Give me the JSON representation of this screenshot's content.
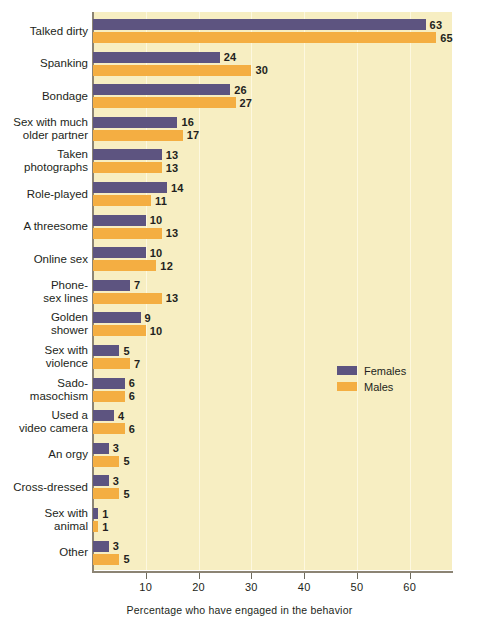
{
  "chart_data": {
    "type": "bar",
    "orientation": "horizontal",
    "title": "",
    "xlabel": "Percentage who have engaged in the behavior",
    "ylabel": "",
    "xlim": [
      0,
      68
    ],
    "xticks": [
      10,
      20,
      30,
      40,
      50,
      60
    ],
    "xticklabels": [
      "10",
      "20",
      "30",
      "40",
      "50",
      "60"
    ],
    "grid": true,
    "grid_axis": "x",
    "legend_position": "center-right",
    "categories": [
      "Talked dirty",
      "Spanking",
      "Bondage",
      "Sex with much\nolder partner",
      "Taken\nphotographs",
      "Role-played",
      "A threesome",
      "Online sex",
      "Phone-\nsex lines",
      "Golden\nshower",
      "Sex with\nviolence",
      "Sado-\nmasochism",
      "Used a\nvideo camera",
      "An orgy",
      "Cross-dressed",
      "Sex with\nanimal",
      "Other"
    ],
    "series": [
      {
        "name": "Females",
        "color": "#5d5480",
        "values": [
          63,
          24,
          26,
          16,
          13,
          14,
          10,
          10,
          7,
          9,
          5,
          6,
          4,
          3,
          3,
          1,
          3
        ]
      },
      {
        "name": "Males",
        "color": "#f4ae42",
        "values": [
          65,
          30,
          27,
          17,
          13,
          11,
          13,
          12,
          13,
          10,
          7,
          6,
          6,
          5,
          5,
          1,
          5
        ]
      }
    ]
  },
  "colors": {
    "plot_background": "#f7eec2",
    "page_background": "#ffffff",
    "axis": "#8c8474",
    "gridline": "#fdf8e0",
    "text": "#231f20",
    "female": "#5d5480",
    "male": "#f4ae42"
  },
  "legend": {
    "items": [
      {
        "label": "Females",
        "color": "#5d5480"
      },
      {
        "label": "Males",
        "color": "#f4ae42"
      }
    ]
  },
  "axis": {
    "x_title": "Percentage who have engaged in the behavior",
    "tick_labels": [
      "10",
      "20",
      "30",
      "40",
      "50",
      "60"
    ]
  }
}
